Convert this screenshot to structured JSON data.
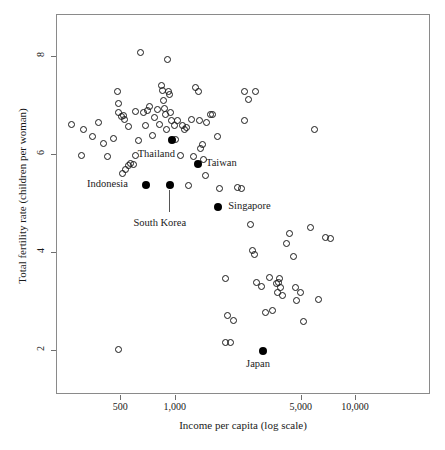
{
  "chart_data": {
    "type": "scatter",
    "title": "",
    "xlabel": "Income per capita (log scale)",
    "ylabel": "Total fertility rate (children per woman)",
    "xscale": "log",
    "xlim": [
      220,
      26000
    ],
    "ylim": [
      1.1,
      8.85
    ],
    "xticks": [
      500,
      1000,
      5000,
      10000
    ],
    "xticklabels": [
      "500",
      "1,000",
      "5,000",
      "10,000"
    ],
    "yticks": [
      8,
      6,
      4,
      2
    ],
    "yticklabels": [
      "8",
      "6",
      "4",
      "2"
    ],
    "grid": false,
    "legend": null,
    "series": [
      {
        "name": "countries",
        "marker": "open-circle",
        "points": [
          {
            "x": 265,
            "y": 6.62
          },
          {
            "x": 310,
            "y": 6.52
          },
          {
            "x": 345,
            "y": 6.38
          },
          {
            "x": 375,
            "y": 6.66
          },
          {
            "x": 300,
            "y": 5.98
          },
          {
            "x": 400,
            "y": 6.23
          },
          {
            "x": 420,
            "y": 5.97
          },
          {
            "x": 455,
            "y": 6.34
          },
          {
            "x": 475,
            "y": 7.28
          },
          {
            "x": 480,
            "y": 6.86
          },
          {
            "x": 485,
            "y": 7.05
          },
          {
            "x": 500,
            "y": 6.78
          },
          {
            "x": 512,
            "y": 6.8
          },
          {
            "x": 520,
            "y": 6.72
          },
          {
            "x": 505,
            "y": 5.62
          },
          {
            "x": 530,
            "y": 5.7
          },
          {
            "x": 545,
            "y": 5.79
          },
          {
            "x": 565,
            "y": 5.83
          },
          {
            "x": 545,
            "y": 6.58
          },
          {
            "x": 585,
            "y": 5.8
          },
          {
            "x": 600,
            "y": 5.98
          },
          {
            "x": 620,
            "y": 6.3
          },
          {
            "x": 600,
            "y": 6.88
          },
          {
            "x": 640,
            "y": 8.08
          },
          {
            "x": 660,
            "y": 6.86
          },
          {
            "x": 680,
            "y": 6.6
          },
          {
            "x": 700,
            "y": 6.9
          },
          {
            "x": 720,
            "y": 6.98
          },
          {
            "x": 745,
            "y": 6.4
          },
          {
            "x": 760,
            "y": 6.75
          },
          {
            "x": 790,
            "y": 6.92
          },
          {
            "x": 810,
            "y": 6.62
          },
          {
            "x": 835,
            "y": 7.42
          },
          {
            "x": 845,
            "y": 7.32
          },
          {
            "x": 860,
            "y": 7.1
          },
          {
            "x": 870,
            "y": 6.95
          },
          {
            "x": 880,
            "y": 6.82
          },
          {
            "x": 885,
            "y": 6.52
          },
          {
            "x": 900,
            "y": 7.94
          },
          {
            "x": 910,
            "y": 7.28
          },
          {
            "x": 925,
            "y": 7.22
          },
          {
            "x": 935,
            "y": 6.86
          },
          {
            "x": 950,
            "y": 6.7
          },
          {
            "x": 980,
            "y": 6.6
          },
          {
            "x": 1000,
            "y": 6.31
          },
          {
            "x": 1030,
            "y": 6.7
          },
          {
            "x": 1060,
            "y": 5.98
          },
          {
            "x": 1090,
            "y": 6.6
          },
          {
            "x": 1120,
            "y": 6.52
          },
          {
            "x": 1150,
            "y": 6.55
          },
          {
            "x": 1180,
            "y": 5.38
          },
          {
            "x": 1230,
            "y": 6.72
          },
          {
            "x": 1290,
            "y": 7.38
          },
          {
            "x": 1340,
            "y": 7.3
          },
          {
            "x": 1360,
            "y": 6.7
          },
          {
            "x": 1380,
            "y": 6.12
          },
          {
            "x": 1410,
            "y": 6.2
          },
          {
            "x": 1430,
            "y": 5.9
          },
          {
            "x": 1460,
            "y": 5.58
          },
          {
            "x": 1550,
            "y": 6.82
          },
          {
            "x": 1610,
            "y": 6.82
          },
          {
            "x": 1700,
            "y": 6.38
          },
          {
            "x": 1760,
            "y": 5.32
          },
          {
            "x": 1900,
            "y": 3.48
          },
          {
            "x": 1930,
            "y": 2.72
          },
          {
            "x": 1880,
            "y": 2.18
          },
          {
            "x": 2020,
            "y": 2.18
          },
          {
            "x": 2100,
            "y": 2.62
          },
          {
            "x": 2200,
            "y": 5.33
          },
          {
            "x": 2420,
            "y": 7.28
          },
          {
            "x": 2400,
            "y": 6.7
          },
          {
            "x": 2520,
            "y": 7.12
          },
          {
            "x": 2600,
            "y": 4.58
          },
          {
            "x": 2680,
            "y": 4.05
          },
          {
            "x": 2720,
            "y": 3.97
          },
          {
            "x": 2780,
            "y": 7.28
          },
          {
            "x": 2820,
            "y": 3.4
          },
          {
            "x": 3000,
            "y": 3.32
          },
          {
            "x": 3150,
            "y": 2.78
          },
          {
            "x": 3300,
            "y": 3.5
          },
          {
            "x": 3450,
            "y": 2.82
          },
          {
            "x": 3600,
            "y": 3.38
          },
          {
            "x": 3650,
            "y": 3.2
          },
          {
            "x": 3720,
            "y": 3.4
          },
          {
            "x": 3760,
            "y": 3.48
          },
          {
            "x": 3820,
            "y": 3.3
          },
          {
            "x": 3900,
            "y": 3.12
          },
          {
            "x": 4100,
            "y": 4.18
          },
          {
            "x": 4300,
            "y": 4.4
          },
          {
            "x": 4500,
            "y": 3.92
          },
          {
            "x": 4600,
            "y": 3.3
          },
          {
            "x": 4700,
            "y": 3.02
          },
          {
            "x": 4900,
            "y": 3.2
          },
          {
            "x": 5100,
            "y": 2.6
          },
          {
            "x": 5600,
            "y": 4.52
          },
          {
            "x": 5900,
            "y": 6.52
          },
          {
            "x": 6200,
            "y": 3.05
          },
          {
            "x": 6800,
            "y": 4.32
          },
          {
            "x": 7200,
            "y": 4.3
          },
          {
            "x": 480,
            "y": 2.02
          },
          {
            "x": 2330,
            "y": 5.32
          },
          {
            "x": 1250,
            "y": 5.96
          },
          {
            "x": 1480,
            "y": 6.65
          }
        ]
      },
      {
        "name": "highlighted-countries",
        "marker": "filled-circle",
        "points": [
          {
            "label": "Thailand",
            "x": 950,
            "y": 6.3
          },
          {
            "label": "Taiwan",
            "x": 1330,
            "y": 5.82
          },
          {
            "label": "Indonesia",
            "x": 685,
            "y": 5.38
          },
          {
            "label": "South Korea",
            "x": 935,
            "y": 5.38
          },
          {
            "label": "Singapore",
            "x": 1720,
            "y": 4.94
          },
          {
            "label": "Japan",
            "x": 3050,
            "y": 2.0
          }
        ]
      }
    ],
    "annotations": [
      {
        "text": "Thailand",
        "for": "Thailand"
      },
      {
        "text": "Taiwan",
        "for": "Taiwan"
      },
      {
        "text": "Indonesia",
        "for": "Indonesia"
      },
      {
        "text": "South Korea",
        "for": "South Korea"
      },
      {
        "text": "Singapore",
        "for": "Singapore"
      },
      {
        "text": "Japan",
        "for": "Japan"
      }
    ]
  }
}
